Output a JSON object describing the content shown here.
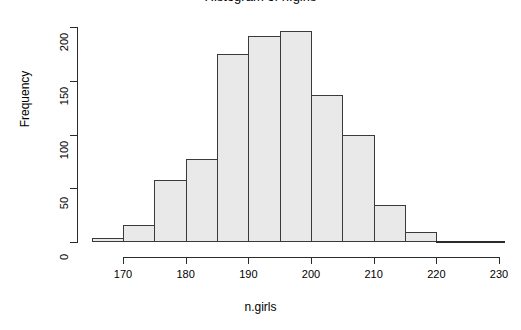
{
  "chart_data": {
    "type": "bar",
    "title": "Histogram of n.girls",
    "xlabel": "n.girls",
    "ylabel": "Frequency",
    "grid": false,
    "legend": null,
    "bin_width": 5,
    "categories": [
      "165-170",
      "170-175",
      "175-180",
      "180-185",
      "185-190",
      "190-195",
      "195-200",
      "200-205",
      "205-210",
      "210-215",
      "215-220"
    ],
    "bin_edges": [
      165,
      170,
      175,
      180,
      185,
      190,
      195,
      200,
      205,
      210,
      215,
      220
    ],
    "values": [
      4,
      16,
      58,
      77,
      175,
      192,
      196,
      137,
      100,
      34,
      9
    ],
    "xlim": [
      165,
      230
    ],
    "ylim": [
      0,
      200
    ],
    "xticks": [
      170,
      180,
      190,
      200,
      210,
      220,
      230
    ],
    "xtick_labels": [
      "170",
      "180",
      "190",
      "200",
      "210",
      "220",
      "230"
    ],
    "yticks": [
      0,
      50,
      100,
      150,
      200
    ],
    "ytick_labels": [
      "0",
      "50",
      "100",
      "150",
      "200"
    ],
    "bar_fill_color": "#e9e9e9",
    "bar_border_color": "#3a3a3a",
    "axis_color": "#2b2b2b",
    "background_color": "#ffffff"
  }
}
